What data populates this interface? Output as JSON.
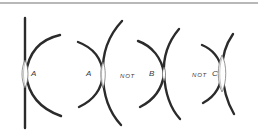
{
  "figure": {
    "colors": {
      "stroke": "#2b2b2b",
      "lens": "#6a6a6a",
      "rule": "#b8b8b8",
      "background": "#ffffff"
    },
    "panels": [
      {
        "id": "panel-1",
        "label_prefix": "",
        "label": "A",
        "description": "straight line against convex arc, contact area A"
      },
      {
        "id": "panel-2",
        "label_prefix": "",
        "label": "A",
        "description": "two opposing convex arcs, contact area A"
      },
      {
        "id": "panel-3",
        "label_prefix": "NOT",
        "label": "B",
        "description": "two opposing arcs, narrow contact B"
      },
      {
        "id": "panel-4",
        "label_prefix": "NOT",
        "label": "C",
        "description": "two opposing arcs, elongated contact C"
      }
    ]
  }
}
